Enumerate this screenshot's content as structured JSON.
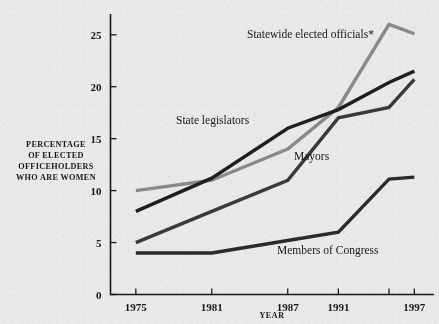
{
  "chart_data": {
    "type": "line",
    "title": "",
    "xlabel": "YEAR",
    "ylabel": "PERCENTAGE OF ELECTED OFFICEHOLDERS WHO ARE WOMEN",
    "ylabel_lines": [
      "PERCENTAGE",
      "OF ELECTED",
      "OFFICEHOLDERS",
      "WHO ARE WOMEN"
    ],
    "x": [
      1975,
      1981,
      1987,
      1991,
      1995,
      1997
    ],
    "xticks": [
      1975,
      1981,
      1987,
      1991,
      1995,
      1997
    ],
    "xtick_labels": [
      "1975",
      "1981",
      "1987",
      "1991",
      "",
      "1997"
    ],
    "yticks": [
      0,
      5,
      10,
      15,
      20,
      25
    ],
    "ytick_labels": [
      "0",
      "5",
      "10",
      "15",
      "20",
      "25"
    ],
    "xlim": [
      1973,
      1998
    ],
    "ylim": [
      0,
      27
    ],
    "grid": false,
    "legend": "inline-annotations",
    "series": [
      {
        "name": "Statewide elected officials*",
        "color": "#8a8a8a",
        "values": [
          10.0,
          11.0,
          14.0,
          18.0,
          26.0,
          25.1
        ]
      },
      {
        "name": "State legislators",
        "color": "#1f1f1f",
        "values": [
          8.0,
          11.2,
          16.0,
          17.8,
          20.4,
          21.5
        ]
      },
      {
        "name": "Mayors",
        "color": "#3a3a3a",
        "values": [
          5.0,
          8.0,
          11.0,
          17.0,
          18.0,
          20.7
        ]
      },
      {
        "name": "Members of Congress",
        "color": "#2b2b2b",
        "values": [
          4.0,
          4.0,
          5.2,
          6.0,
          11.1,
          11.3
        ]
      }
    ],
    "annotations": [
      {
        "name": "statewide-elected-officials-label",
        "text": "Statewide elected officials*",
        "x": 247,
        "y": 38
      },
      {
        "name": "state-legislators-label",
        "text": "State legislators",
        "x": 176,
        "y": 124
      },
      {
        "name": "mayors-label",
        "text": "Mayors",
        "x": 294,
        "y": 160
      },
      {
        "name": "members-of-congress-label",
        "text": "Members of Congress",
        "x": 277,
        "y": 254
      }
    ],
    "footnote_marker": "*"
  },
  "colors": {
    "background": "#e9e9e7",
    "axis": "#1a1a1a",
    "text": "#17171a",
    "accent_gray": "#8a8a8a"
  }
}
